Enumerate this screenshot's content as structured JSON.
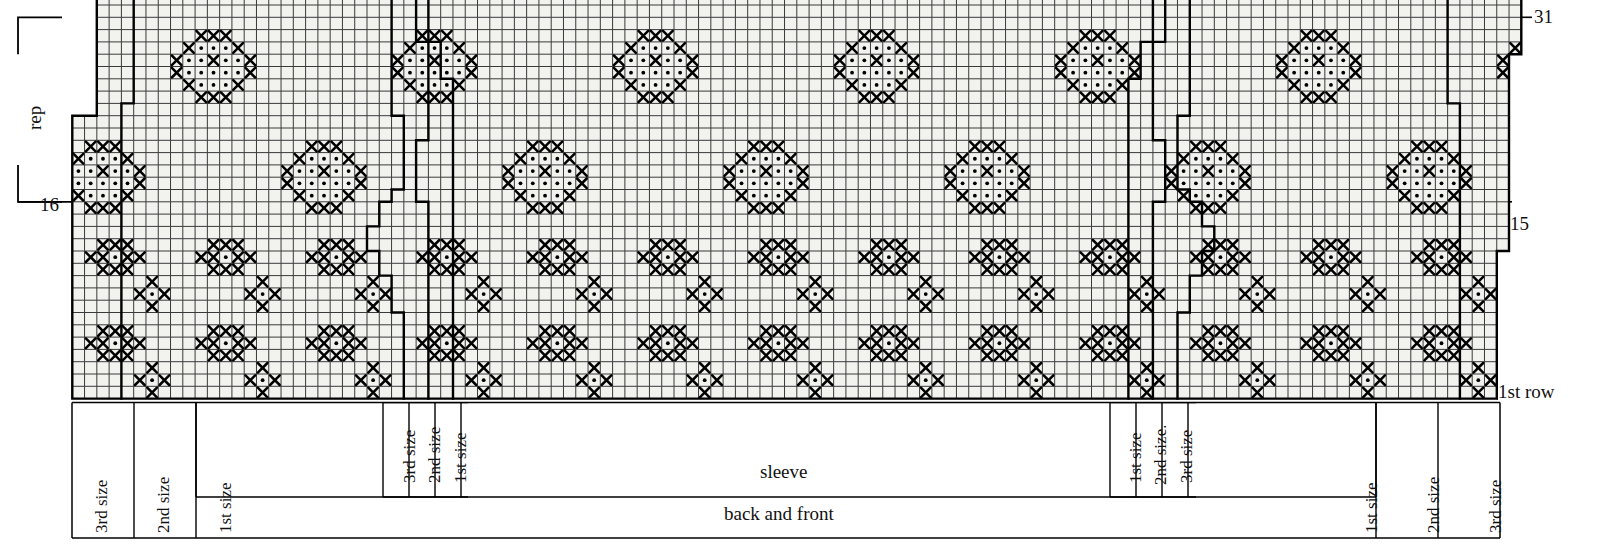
{
  "chart_data": {
    "type": "table",
    "grid": {
      "columns": 119,
      "rows": 33,
      "cell_width": 12.28,
      "cell_height": 12.3,
      "origin_x": 60,
      "origin_y": 5,
      "grid_on": true
    },
    "row_labels": [
      {
        "text": "31",
        "row": 32,
        "side": "right"
      },
      {
        "text": "15",
        "row": 16,
        "side": "right"
      },
      {
        "text": "16",
        "row": 17,
        "side": "left"
      },
      {
        "text": "1st row",
        "row": 1,
        "side": "right"
      }
    ],
    "repeat_bracket": {
      "label": "rep",
      "from_row": 16,
      "to_row": 31
    },
    "symbols": {
      "cross": "x",
      "dot": "o",
      "blank": ""
    },
    "motifs": {
      "large_diamond": {
        "width": 9,
        "height": 9,
        "note": "Large lozenge: dot field bordered by crosses, with internal cross accents",
        "rows": [
          "...xxx...",
          "..x.o.x..",
          ".x.o.x.o.x",
          ".x.ooooo.x",
          ".x.oxo.o.x",
          "x.ooooo.x",
          "..x.o.x..",
          "...xxx...",
          "........."
        ]
      },
      "small_block": {
        "width": 5,
        "height": 3,
        "note": "3x3 block of crosses with centre dot, flanked by single crosses",
        "rows": [
          ".xxx.",
          "xxoxx",
          ".xxx."
        ]
      },
      "small_plus": {
        "width": 3,
        "height": 3,
        "note": "Plus shape: cross above, left, right, below of a centre dot",
        "rows": [
          ".x.",
          "xox",
          ".x."
        ]
      }
    },
    "bands": [
      {
        "name": "band-a",
        "rows": [
          23,
          31
        ],
        "motif": "large_diamond",
        "horizontal_period": 18,
        "phase": 4
      },
      {
        "name": "band-b",
        "rows": [
          14,
          22
        ],
        "motif": "large_diamond",
        "horizontal_period": 18,
        "phase": 13
      },
      {
        "name": "band-c",
        "rows": [
          11,
          13
        ],
        "motif": "small_block",
        "horizontal_period": 9,
        "phase": 2
      },
      {
        "name": "band-d",
        "rows": [
          7,
          9
        ],
        "motif": "small_block",
        "horizontal_period": 9,
        "phase": 6
      },
      {
        "name": "band-e",
        "rows": [
          3,
          5
        ],
        "motif": "small_block",
        "horizontal_period": 9,
        "phase": 2
      },
      {
        "name": "band-f",
        "rows": [
          1,
          2
        ],
        "motif": "small_plus",
        "horizontal_period": 9,
        "phase": 6
      }
    ],
    "shaping_outlines": [
      {
        "name": "left-sleeve-raglan",
        "side": "left",
        "note": "stepped decrease line rising left to right"
      },
      {
        "name": "right-sleeve-raglan",
        "side": "right",
        "note": "mirrored stepped decrease line"
      },
      {
        "name": "left-body-edge",
        "side": "left",
        "note": "outer stepped body edge"
      },
      {
        "name": "right-body-edge",
        "side": "right",
        "note": "outer stepped body edge"
      }
    ]
  },
  "legend_axis": {
    "left_bracket_label": "rep",
    "row_16": "16",
    "row_15": "15",
    "row_31": "31",
    "first_row": "1st row"
  },
  "size_markers": {
    "left_outer": [
      {
        "label": "3rd size",
        "x": 88
      },
      {
        "label": "2nd size",
        "x": 150
      },
      {
        "label": "1st size",
        "x": 212
      }
    ],
    "left_inner": [
      {
        "label": "3rd size",
        "x": 396
      },
      {
        "label": "2nd size",
        "x": 421
      },
      {
        "label": "1st size",
        "x": 447
      }
    ],
    "right_inner": [
      {
        "label": "1st size",
        "x": 1122
      },
      {
        "label": "2nd size.",
        "x": 1147
      },
      {
        "label": "3rd size",
        "x": 1173
      }
    ],
    "right_outer": [
      {
        "label": "1st size",
        "x": 1358
      },
      {
        "label": "2nd size",
        "x": 1420
      },
      {
        "label": "3rd size",
        "x": 1482
      }
    ]
  },
  "sections": {
    "sleeve": "sleeve",
    "back_and_front": "back and front"
  }
}
